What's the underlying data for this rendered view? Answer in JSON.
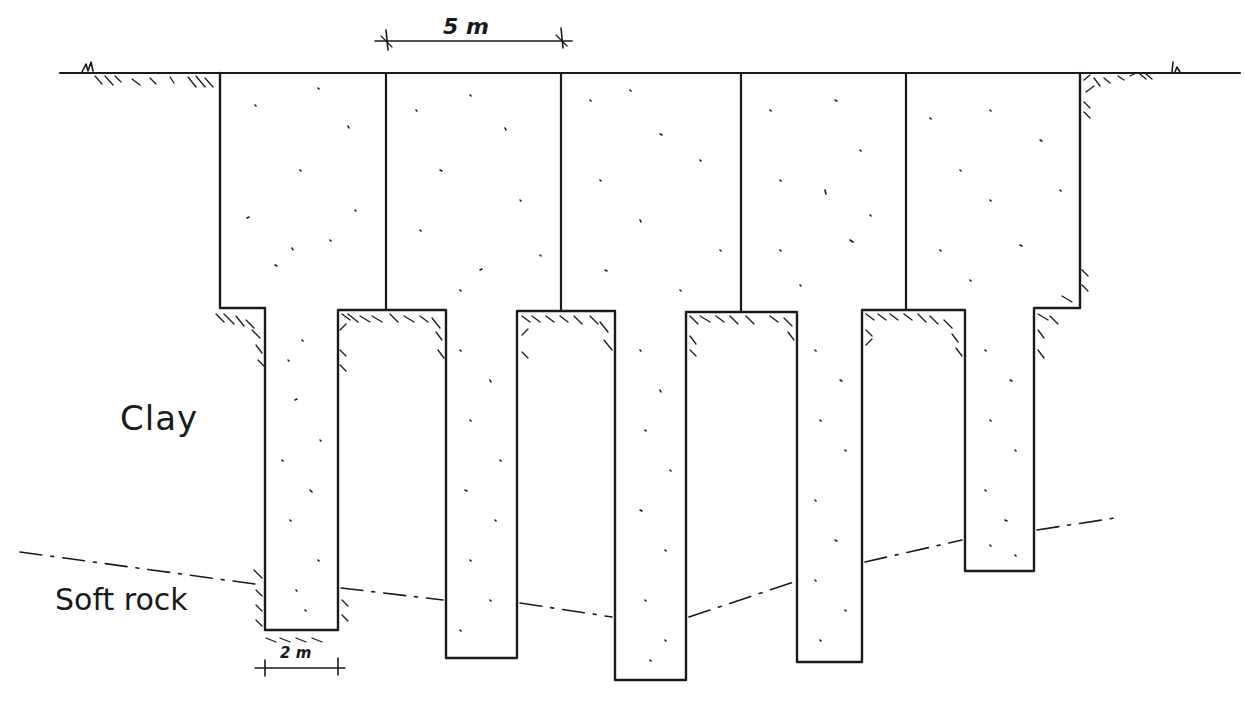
{
  "diagram": {
    "type": "foundation-cross-section-sketch",
    "labels": {
      "upper_layer": "Clay",
      "lower_layer": "Soft rock",
      "panel_width": "5 m",
      "pile_width": "2 m"
    },
    "ground_level_y": 73,
    "block": {
      "left": 220,
      "right": 1080,
      "top": 73,
      "bottom": 308
    },
    "panel_dividers_x": [
      386,
      561,
      741,
      906
    ],
    "piles": [
      {
        "id": "pile-1",
        "left": 265,
        "right": 338,
        "bottom": 630
      },
      {
        "id": "pile-2",
        "left": 446,
        "right": 517,
        "bottom": 658
      },
      {
        "id": "pile-3",
        "left": 615,
        "right": 686,
        "bottom": 680
      },
      {
        "id": "pile-4",
        "left": 797,
        "right": 862,
        "bottom": 662
      },
      {
        "id": "pile-5",
        "left": 965,
        "right": 1034,
        "bottom": 571
      }
    ],
    "rock_boundary_points": [
      [
        20,
        552
      ],
      [
        265,
        585
      ],
      [
        338,
        588
      ],
      [
        446,
        600
      ],
      [
        517,
        603
      ],
      [
        615,
        617
      ],
      [
        686,
        617
      ],
      [
        797,
        582
      ],
      [
        862,
        562
      ],
      [
        965,
        540
      ],
      [
        1034,
        530
      ],
      [
        1115,
        518
      ]
    ],
    "colors": {
      "ink": "#1a1a1a",
      "paper": "#ffffff"
    }
  }
}
